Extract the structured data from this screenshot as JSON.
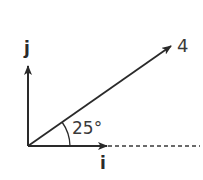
{
  "diagram": {
    "type": "vector-diagram",
    "vector": {
      "magnitude_label": "4",
      "angle_label": "25°",
      "angle_degrees": 25
    },
    "axes": {
      "x_unit_label": "i",
      "y_unit_label": "j"
    },
    "colors": {
      "stroke": "#2a2a2a",
      "text": "#3a3a3a",
      "background": "#ffffff"
    }
  }
}
